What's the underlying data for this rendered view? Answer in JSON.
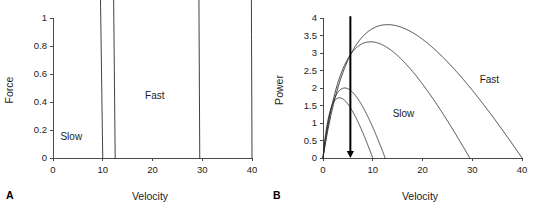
{
  "figure": {
    "background_color": "#ffffff",
    "line_color": "#2b2b2b",
    "axis_color": "#4a4a4a",
    "arrow_color": "#000000"
  },
  "chart_data": [
    {
      "type": "line",
      "panel_label": "A",
      "title": "",
      "xlabel": "Velocity",
      "ylabel": "Force",
      "xlim": [
        0,
        40
      ],
      "ylim": [
        0,
        1
      ],
      "xticks": [
        0,
        10,
        20,
        30,
        40
      ],
      "xtick_labels": [
        "0",
        "10",
        "20",
        "30",
        "40"
      ],
      "yticks": [
        0,
        0.2,
        0.4,
        0.6,
        0.8,
        1
      ],
      "ytick_labels": [
        "0",
        "0.2",
        "0.4",
        "0.6",
        "0.8",
        "1"
      ],
      "grid": false,
      "legend": false,
      "annotations": [
        {
          "text": "Fast",
          "x": 18.5,
          "y": 0.42
        },
        {
          "text": "Slow",
          "x": 1.5,
          "y": 0.13
        }
      ],
      "series": [
        {
          "name": "slow-1",
          "model": "hill",
          "vmax": 10.0,
          "f0": 1.0,
          "a": 0.32,
          "curvature": 0.32
        },
        {
          "name": "slow-2",
          "model": "hill",
          "vmax": 12.5,
          "f0": 1.0,
          "a": 0.4,
          "curvature": 0.4
        },
        {
          "name": "fast-1",
          "model": "hill",
          "vmax": 29.5,
          "f0": 1.0,
          "a": 0.3,
          "curvature": 0.3
        },
        {
          "name": "fast-2",
          "model": "hill",
          "vmax": 40.0,
          "f0": 1.0,
          "a": 0.3,
          "curvature": 0.3
        }
      ]
    },
    {
      "type": "line",
      "panel_label": "B",
      "title": "",
      "xlabel": "Velocity",
      "ylabel": "Power",
      "xlim": [
        0,
        40
      ],
      "ylim": [
        0,
        4
      ],
      "xticks": [
        0,
        10,
        20,
        30,
        40
      ],
      "xtick_labels": [
        "0",
        "10",
        "20",
        "30",
        "40"
      ],
      "yticks": [
        0,
        0.5,
        1,
        1.5,
        2,
        2.5,
        3,
        3.5,
        4
      ],
      "ytick_labels": [
        "0",
        "0.5",
        "1",
        "1.5",
        "2",
        "2.5",
        "3",
        "3.5",
        "4"
      ],
      "grid": false,
      "legend": false,
      "annotations": [
        {
          "text": "Fast",
          "x": 31.5,
          "y": 2.15
        },
        {
          "text": "Slow",
          "x": 14.0,
          "y": 1.18
        }
      ],
      "arrow": {
        "name": "velocity-marker-arrow",
        "x": 5.5,
        "y_start": 4.05,
        "y_end": 0.0,
        "direction": "down"
      },
      "series": [
        {
          "name": "slow-1",
          "model": "hill-power",
          "vmax": 10.0,
          "f0": 1.0,
          "a": 0.32,
          "peak_power": 1.72,
          "peak_velocity": 3.6
        },
        {
          "name": "slow-2",
          "model": "hill-power",
          "vmax": 12.5,
          "f0": 1.0,
          "a": 0.4,
          "peak_power": 2.0,
          "peak_velocity": 4.9
        },
        {
          "name": "fast-1",
          "model": "hill-power",
          "vmax": 29.5,
          "f0": 1.0,
          "a": 0.3,
          "peak_power": 3.32,
          "peak_velocity": 10.2
        },
        {
          "name": "fast-2",
          "model": "hill-power",
          "vmax": 40.0,
          "f0": 1.0,
          "a": 0.3,
          "peak_power": 3.81,
          "peak_velocity": 12.0
        }
      ]
    }
  ]
}
